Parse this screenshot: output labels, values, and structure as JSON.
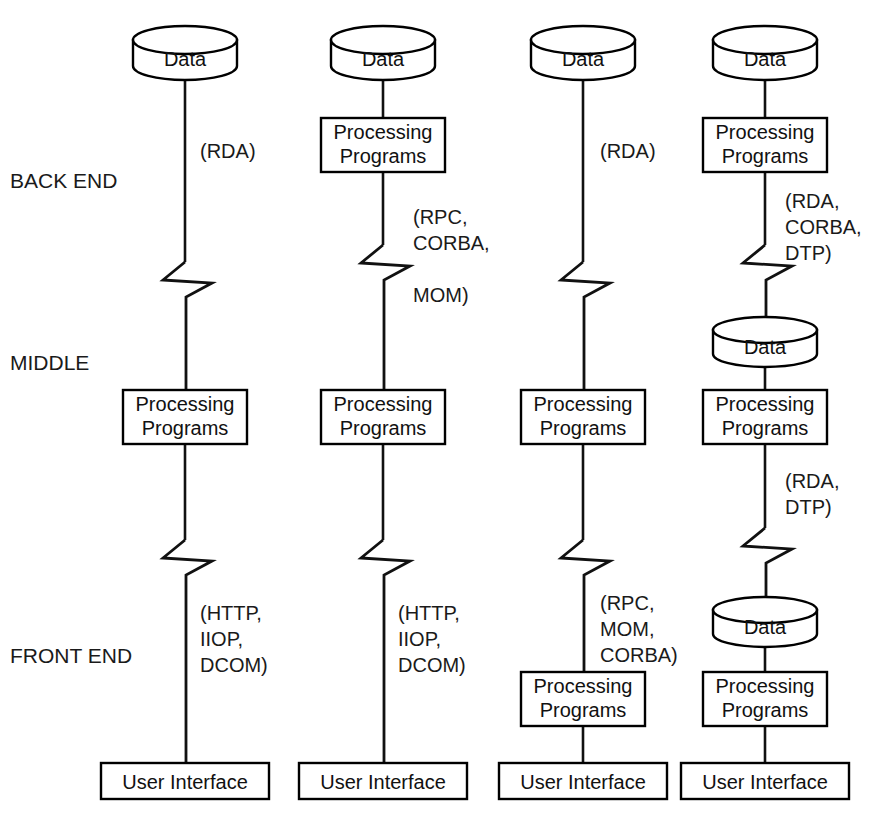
{
  "diagram": {
    "background_color": "#ffffff",
    "line_color": "#111111",
    "text_color": "#1a1a1a",
    "tier_labels": [
      {
        "id": "back-end",
        "text": "BACK END",
        "x": 10,
        "y": 188
      },
      {
        "id": "middle",
        "text": "MIDDLE",
        "x": 10,
        "y": 370
      },
      {
        "id": "front-end",
        "text": "FRONT END",
        "x": 10,
        "y": 663
      }
    ],
    "node_text": {
      "data": "Data",
      "processing_programs_line1": "Processing",
      "processing_programs_line2": "Programs",
      "user_interface": "User Interface"
    },
    "columns": [
      {
        "id": "column-1",
        "center_x": 185,
        "nodes": [
          {
            "type": "cylinder",
            "label": "Data",
            "cx": 185,
            "top": 28,
            "w": 104,
            "h": 50
          },
          {
            "type": "box",
            "label": "Processing\nPrograms",
            "cx": 185,
            "top": 390,
            "w": 124,
            "h": 54
          },
          {
            "type": "box",
            "label": "User Interface",
            "cx": 185,
            "top": 763,
            "w": 168,
            "h": 36
          }
        ],
        "protocol_labels": [
          {
            "id": "col1-proto-1",
            "lines": [
              "(RDA)"
            ],
            "x": 200,
            "y": 158
          },
          {
            "id": "col1-proto-2",
            "lines": [
              "(HTTP,",
              "IIOP,",
              "DCOM)"
            ],
            "x": 200,
            "y": 620
          }
        ]
      },
      {
        "id": "column-2",
        "center_x": 383,
        "nodes": [
          {
            "type": "cylinder",
            "label": "Data",
            "cx": 383,
            "top": 28,
            "w": 104,
            "h": 50
          },
          {
            "type": "box",
            "label": "Processing\nPrograms",
            "cx": 383,
            "top": 118,
            "w": 124,
            "h": 54
          },
          {
            "type": "box",
            "label": "Processing\nPrograms",
            "cx": 383,
            "top": 390,
            "w": 124,
            "h": 54
          },
          {
            "type": "box",
            "label": "User Interface",
            "cx": 383,
            "top": 763,
            "w": 168,
            "h": 36
          }
        ],
        "protocol_labels": [
          {
            "id": "col2-proto-1",
            "lines": [
              "(RPC,",
              "CORBA,",
              "",
              "MOM)"
            ],
            "x": 413,
            "y": 224
          },
          {
            "id": "col2-proto-2",
            "lines": [
              "(HTTP,",
              "IIOP,",
              "DCOM)"
            ],
            "x": 398,
            "y": 620
          }
        ]
      },
      {
        "id": "column-3",
        "center_x": 583,
        "nodes": [
          {
            "type": "cylinder",
            "label": "Data",
            "cx": 583,
            "top": 28,
            "w": 104,
            "h": 50
          },
          {
            "type": "box",
            "label": "Processing\nPrograms",
            "cx": 583,
            "top": 390,
            "w": 124,
            "h": 54
          },
          {
            "type": "box",
            "label": "Processing\nPrograms",
            "cx": 583,
            "top": 672,
            "w": 124,
            "h": 54
          },
          {
            "type": "box",
            "label": "User Interface",
            "cx": 583,
            "top": 763,
            "w": 168,
            "h": 36
          }
        ],
        "protocol_labels": [
          {
            "id": "col3-proto-1",
            "lines": [
              "(RDA)"
            ],
            "x": 600,
            "y": 158
          },
          {
            "id": "col3-proto-2",
            "lines": [
              "(RPC,",
              "MOM,",
              "CORBA)"
            ],
            "x": 600,
            "y": 610
          }
        ]
      },
      {
        "id": "column-4",
        "center_x": 765,
        "nodes": [
          {
            "type": "cylinder",
            "label": "Data",
            "cx": 765,
            "top": 28,
            "w": 104,
            "h": 50
          },
          {
            "type": "box",
            "label": "Processing\nPrograms",
            "cx": 765,
            "top": 118,
            "w": 124,
            "h": 54
          },
          {
            "type": "cylinder",
            "label": "Data",
            "cx": 765,
            "top": 318,
            "w": 104,
            "h": 48
          },
          {
            "type": "box",
            "label": "Processing\nPrograms",
            "cx": 765,
            "top": 390,
            "w": 124,
            "h": 54
          },
          {
            "type": "cylinder",
            "label": "Data",
            "cx": 765,
            "top": 598,
            "w": 104,
            "h": 48
          },
          {
            "type": "box",
            "label": "Processing\nPrograms",
            "cx": 765,
            "top": 672,
            "w": 124,
            "h": 54
          },
          {
            "type": "box",
            "label": "User Interface",
            "cx": 765,
            "top": 763,
            "w": 168,
            "h": 36
          }
        ],
        "protocol_labels": [
          {
            "id": "col4-proto-1",
            "lines": [
              "(RDA,",
              "CORBA,",
              "DTP)"
            ],
            "x": 785,
            "y": 208
          },
          {
            "id": "col4-proto-2",
            "lines": [
              "(RDA,",
              "DTP)"
            ],
            "x": 785,
            "y": 488
          }
        ]
      }
    ]
  }
}
